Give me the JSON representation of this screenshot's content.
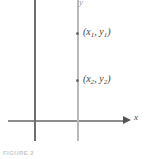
{
  "figure": {
    "caption": "FIGURE 2",
    "axis_x_label": "x",
    "axis_y_label": "y",
    "point_labels": {
      "p1_open": "(",
      "p1_x": "x",
      "p1_xsub": "1",
      "p1_comma": ", ",
      "p1_y": "y",
      "p1_ysub": "1",
      "p1_close": ")",
      "p2_open": "(",
      "p2_x": "x",
      "p2_xsub": "2",
      "p2_comma": ", ",
      "p2_y": "y",
      "p2_ysub": "2",
      "p2_close": ")"
    },
    "colors": {
      "axis": "#8d8d8d",
      "y_axis": "#6e6e6e",
      "vertical_line": "#b9b9b9",
      "point": "#6a6a6a",
      "label_text": "#3f3f3f",
      "caption_text": "#c9c9c9",
      "background": "#ffffff"
    }
  },
  "chart_data": {
    "type": "scatter",
    "title": "FIGURE 2",
    "xlabel": "x",
    "ylabel": "y",
    "grid": false,
    "legend": "none",
    "annotations": [
      "(x1, y1)",
      "(x2, y2)"
    ],
    "series": [
      {
        "name": "points-on-vertical-line",
        "points": [
          {
            "label": "(x1, y1)",
            "px_x": 77,
            "px_y": 33
          },
          {
            "label": "(x2, y2)",
            "px_x": 77,
            "px_y": 80
          }
        ]
      }
    ],
    "lines": [
      {
        "name": "y-axis",
        "orientation": "vertical",
        "px_x": 35
      },
      {
        "name": "vertical-test-line",
        "orientation": "vertical",
        "px_x": 78
      },
      {
        "name": "x-axis",
        "orientation": "horizontal",
        "px_y": 121
      }
    ]
  }
}
